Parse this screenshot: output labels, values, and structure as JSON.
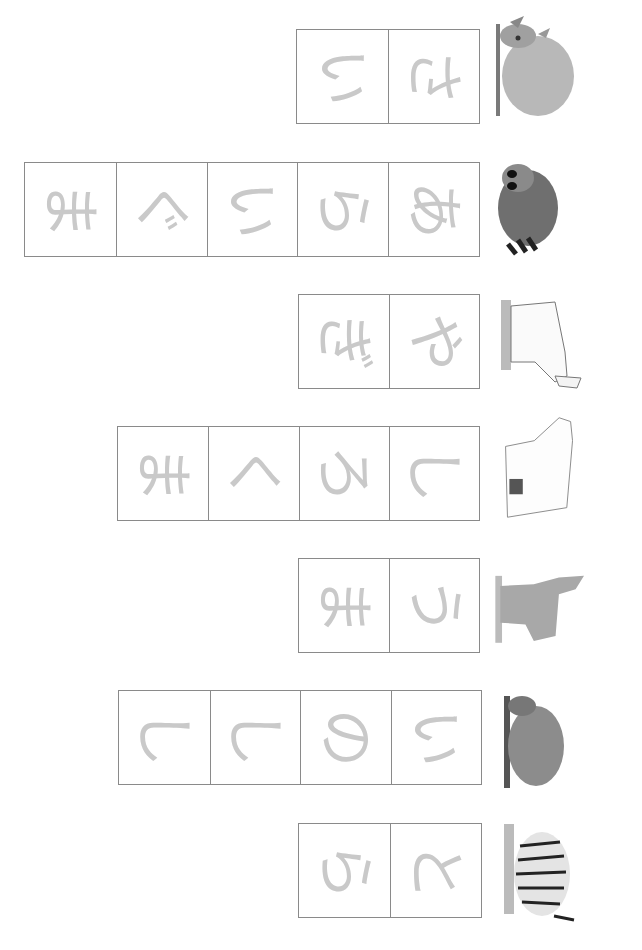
{
  "worksheet": {
    "orientation": "rotated 90deg clockwise",
    "trace_color": "#c9c9c9",
    "border_color": "#8a8a8a",
    "rows": [
      {
        "animal": "rhinoceros",
        "icon": "rhinoceros-icon",
        "word": "さい",
        "chars": [
          "さ",
          "い"
        ]
      },
      {
        "animal": "raccoon",
        "icon": "raccoon-icon",
        "word": "あらいぐま",
        "chars": [
          "あ",
          "ら",
          "い",
          "ぐ",
          "ま"
        ]
      },
      {
        "animal": "goat",
        "icon": "goat-icon",
        "word": "やぎ",
        "chars": [
          "や",
          "ぎ"
        ]
      },
      {
        "animal": "polar bear",
        "icon": "polar-bear-icon",
        "word": "しろくま",
        "chars": [
          "し",
          "ろ",
          "く",
          "ま"
        ]
      },
      {
        "animal": "horse",
        "icon": "horse-icon",
        "word": "うま",
        "chars": [
          "う",
          "ま"
        ]
      },
      {
        "animal": "wild boar",
        "icon": "boar-icon",
        "word": "いのしし",
        "chars": [
          "い",
          "の",
          "し",
          "し"
        ]
      },
      {
        "animal": "tiger",
        "icon": "tiger-icon",
        "word": "とら",
        "chars": [
          "と",
          "ら"
        ]
      }
    ]
  }
}
